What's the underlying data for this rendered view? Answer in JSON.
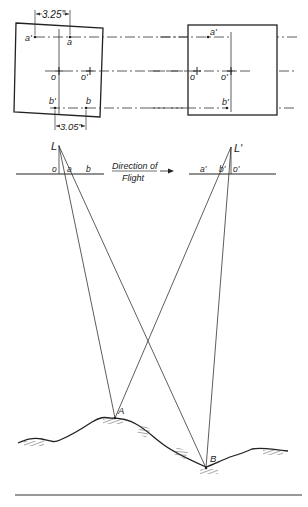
{
  "figure": {
    "photos": {
      "left": {
        "labels": {
          "a_prime": "a'",
          "a": "a",
          "o": "o",
          "o_prime": "o'",
          "b_prime": "b'",
          "b": "b"
        },
        "dim_top": "3.25\"",
        "dim_bottom": "3.05\""
      },
      "right": {
        "labels": {
          "a_prime": "a'",
          "o": "o",
          "o_prime": "o'",
          "b_prime": "b'"
        }
      }
    },
    "stations": {
      "left": {
        "exposure": "L",
        "labels": {
          "o": "o",
          "a": "a",
          "b": "b"
        }
      },
      "right": {
        "exposure": "L'",
        "labels": {
          "a_prime": "a'",
          "b_prime": "b'",
          "o_prime": "o'"
        }
      }
    },
    "direction": {
      "line1": "Direction of",
      "line2": "Flight"
    },
    "ground_points": {
      "A": "A",
      "B": "B"
    },
    "colors": {
      "ink": "#222222",
      "hatch": "#555555",
      "background": "#ffffff"
    }
  }
}
